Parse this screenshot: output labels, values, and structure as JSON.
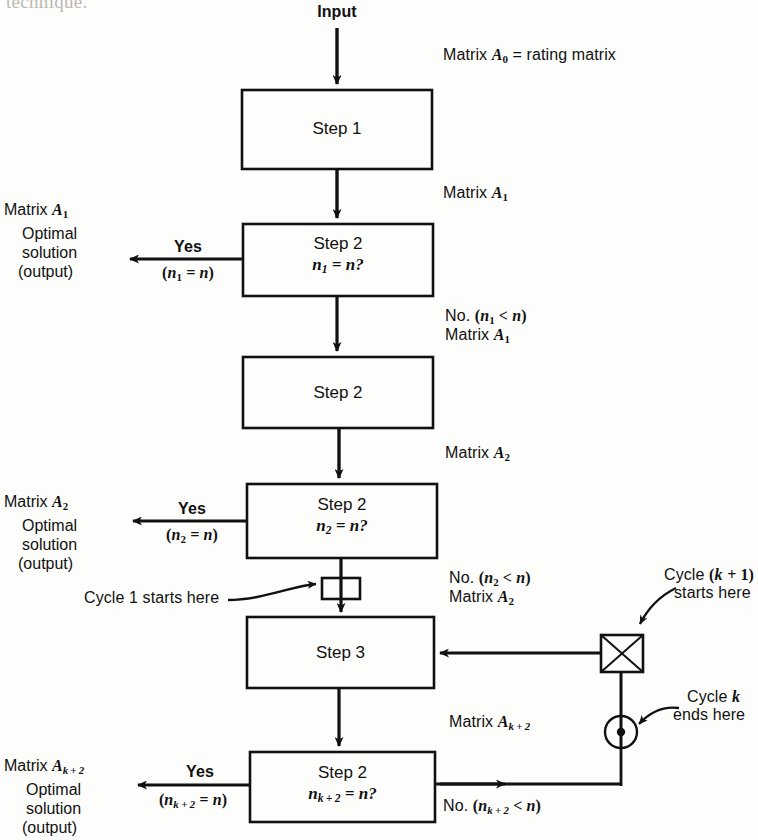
{
  "figure": {
    "type": "flowchart",
    "title_fragment": "technique.",
    "entry_label": "Input"
  },
  "nodes": [
    {
      "id": "step1",
      "label": "Step 1",
      "sublabel": "",
      "shape": "rect"
    },
    {
      "id": "step2a",
      "label": "Step 2",
      "sublabel": "n₁ = n?",
      "shape": "rect"
    },
    {
      "id": "step2b",
      "label": "Step 2",
      "sublabel": "",
      "shape": "rect"
    },
    {
      "id": "step2c",
      "label": "Step 2",
      "sublabel": "n₂ = n?",
      "shape": "rect"
    },
    {
      "id": "step3",
      "label": "Step 3",
      "sublabel": "",
      "shape": "rect"
    },
    {
      "id": "step2d",
      "label": "Step 2",
      "sublabel": "nₖ₊₂ = n?",
      "shape": "rect"
    },
    {
      "id": "cycle1-marker",
      "label": "",
      "shape": "small-square"
    },
    {
      "id": "cycle-k1-marker",
      "label": "",
      "shape": "crossed-square"
    },
    {
      "id": "cycle-k-end-marker",
      "label": "",
      "shape": "dot-circle"
    }
  ],
  "edge_labels": {
    "matrix_a0": "Matrix A0 = rating matrix",
    "matrix_a1": "Matrix A1",
    "no_n1": "No. (n1 < n)",
    "matrix_a1_b": "Matrix A1",
    "matrix_a2": "Matrix A2",
    "no_n2": "No. (n2 < n)",
    "matrix_a2_b": "Matrix A2",
    "matrix_ak2": "Matrix Ak+2",
    "yes": "Yes",
    "cond_n1_eq": "(n1 = n)",
    "cond_n2_eq": "(n2 = n)",
    "cond_nk2_eq": "(nk+2 = n)",
    "no_nk2": "No. (nk+2 < n)"
  },
  "output_blocks": [
    {
      "id": "out1",
      "line1": "Matrix A1",
      "line2": "Optimal",
      "line3": "solution",
      "line4": "(output)"
    },
    {
      "id": "out2",
      "line1": "Matrix A2",
      "line2": "Optimal",
      "line3": "solution",
      "line4": "(output)"
    },
    {
      "id": "out3",
      "line1": "Matrix Ak+2",
      "line2": "Optimal",
      "line3": "solution",
      "line4": "(output)"
    }
  ],
  "annotations": [
    {
      "id": "cycle1",
      "text": "Cycle 1 starts here"
    },
    {
      "id": "cyclek1",
      "line1": "Cycle (k + 1)",
      "line2": "starts here"
    },
    {
      "id": "cyclek",
      "line1": "Cycle k",
      "line2": "ends here"
    }
  ],
  "colors": {
    "ink": "#111111",
    "paper": "#fdfdfb",
    "faded": "#b9b9b4"
  }
}
